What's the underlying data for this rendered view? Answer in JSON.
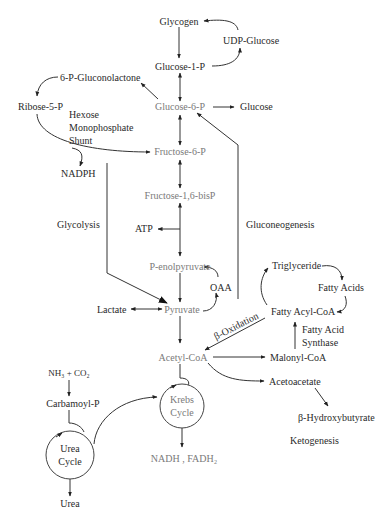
{
  "diagram": {
    "type": "metabolic-pathway",
    "nodes": {
      "glycogen": "Glycogen",
      "udp_glucose": "UDP-Glucose",
      "glucose_1p": "Glucose-1-P",
      "gluconolactone": "6-P-Gluconolactone",
      "ribose_5p": "Ribose-5-P",
      "glucose_6p": "Glucose-6-P",
      "glucose": "Glucose",
      "hms_1": "Hexose",
      "hms_2": "Monophosphate",
      "hms_3": "Shunt",
      "fructose_6p": "Fructose-6-P",
      "nadph": "NADPH",
      "fructose_16bisp": "Fructose-1,6-bisP",
      "glycolysis": "Glycolysis",
      "atp": "ATP",
      "gluconeogenesis": "Gluconeogenesis",
      "pep": "P-enolpyruvate",
      "triglyceride": "Triglyceride",
      "fatty_acids": "Fatty Acids",
      "oaa": "OAA",
      "lactate": "Lactate",
      "pyruvate": "Pyruvate",
      "fatty_acyl_coa": "Fatty Acyl-CoA",
      "beta_oxidation": "β-Oxidation",
      "fas_1": "Fatty Acid",
      "fas_2": "Synthase",
      "acetyl_coa": "Acetyl-CoA",
      "malonyl_coa": "Malonyl-CoA",
      "nh3_co2": "NH₃ + CO₂",
      "acetoacetate": "Acetoacetate",
      "carbamoyl_p": "Carbamoyl-P",
      "krebs_1": "Krebs",
      "krebs_2": "Cycle",
      "urea_cycle_1": "Urea",
      "urea_cycle_2": "Cycle",
      "beta_hydroxybutyrate": "β-Hydroxybutyrate",
      "ketogenesis": "Ketogenesis",
      "nadh_fadh2": "NADH , FADH₂",
      "urea": "Urea"
    },
    "edges": [
      {
        "from": "Glycogen",
        "to": "Glucose-1-P"
      },
      {
        "from": "Glucose-1-P",
        "to": "UDP-Glucose"
      },
      {
        "from": "UDP-Glucose",
        "to": "Glycogen"
      },
      {
        "from": "Glucose-1-P",
        "to": "Glucose-6-P",
        "bidirectional": true
      },
      {
        "from": "Glucose-6-P",
        "to": "6-P-Gluconolactone"
      },
      {
        "from": "6-P-Gluconolactone",
        "to": "Ribose-5-P"
      },
      {
        "from": "Ribose-5-P",
        "to": "Fructose-6-P"
      },
      {
        "from": "Ribose-5-P",
        "to": "NADPH"
      },
      {
        "from": "Glucose-6-P",
        "to": "Glucose"
      },
      {
        "from": "Glucose-6-P",
        "to": "Fructose-6-P",
        "bidirectional": true
      },
      {
        "from": "Fructose-6-P",
        "to": "Fructose-1,6-bisP",
        "bidirectional": true
      },
      {
        "from": "Fructose-1,6-bisP",
        "to": "P-enolpyruvate",
        "bidirectional": true
      },
      {
        "from": "Fructose-1,6-bisP",
        "to": "ATP"
      },
      {
        "from": "P-enolpyruvate",
        "to": "Pyruvate"
      },
      {
        "from": "Pyruvate",
        "to": "OAA"
      },
      {
        "from": "OAA",
        "to": "P-enolpyruvate"
      },
      {
        "from": "Lactate",
        "to": "Pyruvate",
        "bidirectional": true
      },
      {
        "from": "Glycolysis",
        "to": "Pyruvate"
      },
      {
        "from": "Gluconeogenesis",
        "to": "Glucose-6-P"
      },
      {
        "from": "Pyruvate",
        "to": "Acetyl-CoA"
      },
      {
        "from": "Fatty Acyl-CoA",
        "to": "Acetyl-CoA",
        "label": "β-Oxidation"
      },
      {
        "from": "Acetyl-CoA",
        "to": "Malonyl-CoA"
      },
      {
        "from": "Malonyl-CoA",
        "to": "Fatty Acyl-CoA",
        "label": "Fatty Acid Synthase"
      },
      {
        "from": "Fatty Acyl-CoA",
        "to": "Triglyceride"
      },
      {
        "from": "Triglyceride",
        "to": "Fatty Acids"
      },
      {
        "from": "Fatty Acids",
        "to": "Fatty Acyl-CoA"
      },
      {
        "from": "Acetyl-CoA",
        "to": "Acetoacetate"
      },
      {
        "from": "Acetoacetate",
        "to": "β-Hydroxybutyrate"
      },
      {
        "from": "Acetyl-CoA",
        "to": "Krebs Cycle"
      },
      {
        "from": "Krebs Cycle",
        "to": "NADH , FADH₂"
      },
      {
        "from": "NH₃ + CO₂",
        "to": "Carbamoyl-P"
      },
      {
        "from": "Carbamoyl-P",
        "to": "Urea Cycle"
      },
      {
        "from": "Urea Cycle",
        "to": "Krebs Cycle"
      },
      {
        "from": "Urea Cycle",
        "to": "Urea"
      }
    ]
  }
}
